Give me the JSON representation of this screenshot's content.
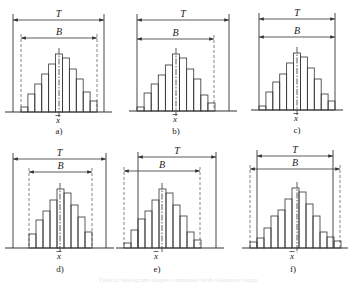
{
  "figure": {
    "colors": {
      "line": "#333333",
      "dashed": "#666666",
      "background": "#ffffff"
    },
    "symbols": {
      "tolerance": "T",
      "spread": "B",
      "mean": "x̄"
    },
    "panels": [
      {
        "label": "a)",
        "baseline": 112,
        "t_y": 20,
        "b_y": 38,
        "t_x": [
          13,
          104
        ],
        "b_x": [
          21,
          97
        ],
        "b_dashed": [
          true,
          true
        ],
        "bar_x0": 21,
        "bar_x1": 97,
        "heights": [
          5,
          18,
          28,
          38,
          48,
          58,
          54,
          43,
          33,
          20,
          11
        ],
        "center_x": 59,
        "mean_x": 58,
        "label_y": 134,
        "top_y": 14
      },
      {
        "label": "b)",
        "baseline": 111,
        "t_y": 20,
        "b_y": 39,
        "t_x": [
          137,
          229
        ],
        "b_x": [
          137,
          214
        ],
        "b_dashed": [
          false,
          true
        ],
        "bar_x0": 137,
        "bar_x1": 215,
        "heights": [
          4,
          18,
          27,
          36,
          46,
          57,
          53,
          42,
          32,
          16,
          8
        ],
        "center_x": 176,
        "mean_x": 175,
        "label_y": 134,
        "top_y": 14
      },
      {
        "label": "c)",
        "baseline": 110,
        "t_y": 19,
        "b_y": 37,
        "t_x": [
          259,
          335
        ],
        "b_x": [
          259,
          335
        ],
        "b_dashed": [
          false,
          false
        ],
        "bar_x0": 259,
        "bar_x1": 335,
        "heights": [
          4,
          18,
          28,
          36,
          47,
          57,
          53,
          42,
          31,
          16,
          9
        ],
        "center_x": 297,
        "mean_x": 296,
        "label_y": 133,
        "top_y": 13
      },
      {
        "label": "d)",
        "baseline": 248,
        "t_y": 159,
        "b_y": 172,
        "t_x": [
          13,
          106
        ],
        "b_x": [
          29,
          92
        ],
        "b_dashed": [
          true,
          true
        ],
        "bar_x0": 29,
        "bar_x1": 92,
        "heights": [
          14,
          28,
          37,
          48,
          59,
          55,
          43,
          31,
          16
        ],
        "center_x": 60,
        "mean_x": 59,
        "label_y": 272,
        "top_y": 153
      },
      {
        "label": "e)",
        "baseline": 248,
        "t_y": 157,
        "b_y": 171,
        "t_x": [
          138,
          216
        ],
        "b_x": [
          124,
          200
        ],
        "b_dashed": [
          true,
          true
        ],
        "bar_x0": 124,
        "bar_x1": 201,
        "heights": [
          5,
          18,
          29,
          37,
          48,
          59,
          55,
          43,
          32,
          16,
          8
        ],
        "center_x": 162,
        "mean_x": 156,
        "label_y": 272,
        "top_y": 152
      },
      {
        "label": "f)",
        "baseline": 248,
        "t_y": 156,
        "b_y": 169,
        "t_x": [
          257,
          333
        ],
        "b_x": [
          250,
          340
        ],
        "b_dashed": [
          true,
          true
        ],
        "bar_x0": 250,
        "bar_x1": 341,
        "heights": [
          6,
          10,
          20,
          32,
          38,
          49,
          60,
          56,
          44,
          32,
          16,
          11,
          7
        ],
        "center_x": 297,
        "mean_x": 292,
        "label_y": 272,
        "top_y": 150
      }
    ]
  },
  "caption": "Typical histogram shapes compared with tolerance range"
}
